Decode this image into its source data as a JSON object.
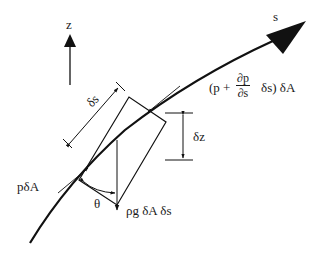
{
  "diagram": {
    "colors": {
      "line": "#111111",
      "background": "#ffffff"
    },
    "labels": {
      "z_axis": "z",
      "s_axis": "s",
      "delta_s_dim": "δs",
      "delta_z_dim": "δz",
      "pressure_upstream": "pδA",
      "pressure_downstream_open": "(p +",
      "pressure_downstream_frac_num": "∂p",
      "pressure_downstream_frac_den": "∂s",
      "pressure_downstream_close": "δs) δA",
      "weight": "ρg δA δs",
      "angle": "θ"
    }
  }
}
